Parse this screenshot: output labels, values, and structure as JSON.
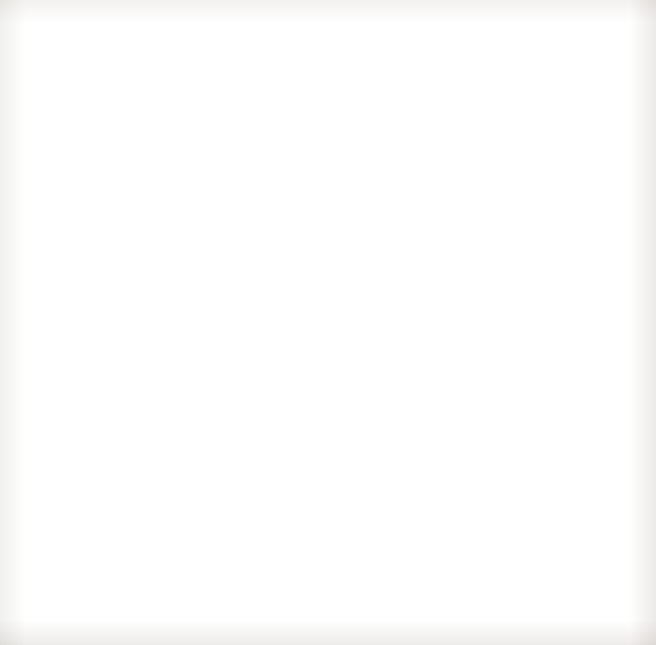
{
  "chart_data": {
    "type": "bar",
    "orientation": "horizontal",
    "stacked": true,
    "title": "Healthcare Expenditures in 14 Countries",
    "xlabel": "Healthcare expenditure (U.S. dollars per person)",
    "ylabel": "",
    "xlim": [
      0,
      9600
    ],
    "xticks": [
      0,
      3000,
      6000,
      9000
    ],
    "xtick_labels": [
      "0",
      "3,000",
      "6,000",
      "9,000"
    ],
    "grid": false,
    "legend_position": "inside-right",
    "categories": [
      "United States",
      "Switzerland",
      "Netherlands",
      "Canada",
      "Germany",
      "France",
      "Australia",
      "Japan",
      "United Kingdom",
      "Italy",
      "Israel",
      "Chile",
      "Mexico",
      "China"
    ],
    "series": [
      {
        "name": "Public",
        "color": "#b2b2b2",
        "values": [
          4100,
          3700,
          4300,
          3250,
          3500,
          3250,
          2700,
          2950,
          2850,
          2400,
          1350,
          750,
          550,
          300
        ]
      },
      {
        "name": "Private",
        "color": "#414141",
        "values": [
          5100,
          2450,
          1100,
          1450,
          1250,
          1000,
          1350,
          650,
          650,
          650,
          950,
          850,
          600,
          200
        ]
      }
    ],
    "totals": [
      9200,
      6150,
      5400,
      4700,
      4750,
      4250,
      4050,
      3600,
      3500,
      3050,
      2300,
      1600,
      1150,
      500
    ]
  },
  "legend": {
    "items": [
      {
        "label": "Public",
        "color": "#b2b2b2"
      },
      {
        "label": "Private",
        "color": "#414141"
      }
    ]
  }
}
